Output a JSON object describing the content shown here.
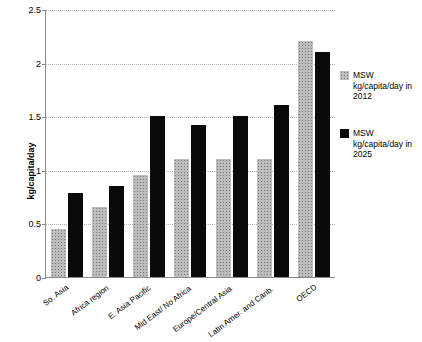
{
  "chart_data": {
    "type": "bar",
    "title": "",
    "xlabel": "",
    "ylabel": "kg/capita/day",
    "ylim": [
      0,
      2.5
    ],
    "yticks": [
      "0",
      "0.5",
      "1",
      "1.5",
      "2",
      "2.5"
    ],
    "grid": true,
    "legend_position": "right",
    "categories": [
      "So. Asia",
      "Africa region",
      "E. Asia Pacific",
      "Mid East/ No Africa",
      "Europe/Central Asia",
      "Latin Amer. and Carib.",
      "OECD"
    ],
    "series": [
      {
        "name": "MSW kg/capita/day in 2012",
        "color": "#bdbdbd",
        "values": [
          0.45,
          0.65,
          0.95,
          1.1,
          1.1,
          1.1,
          2.2
        ]
      },
      {
        "name": "MSW kg/capita/day in 2025",
        "color": "#0a0a0a",
        "values": [
          0.78,
          0.85,
          1.5,
          1.42,
          1.5,
          1.6,
          2.1
        ]
      }
    ]
  },
  "legend": {
    "items": [
      {
        "label": "MSW kg/capita/day in 2012"
      },
      {
        "label": "MSW kg/capita/day in 2025"
      }
    ]
  }
}
